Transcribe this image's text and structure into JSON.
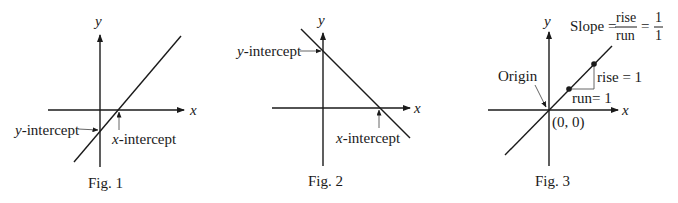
{
  "colors": {
    "ink": "#1a1a1a",
    "guide": "#555555",
    "background": "#ffffff"
  },
  "figures": [
    {
      "caption": "Fig. 1",
      "axis_x_label": "x",
      "axis_y_label": "y",
      "line": "positive slope, crosses x-axis right of origin and y-axis below origin",
      "annotations": {
        "y_intercept": "y-intercept",
        "x_intercept": "x-intercept"
      }
    },
    {
      "caption": "Fig. 2",
      "axis_x_label": "x",
      "axis_y_label": "y",
      "line": "negative slope, crosses y-axis above origin and x-axis right of origin",
      "annotations": {
        "y_intercept": "y-intercept",
        "x_intercept": "x-intercept"
      }
    },
    {
      "caption": "Fig. 3",
      "axis_x_label": "x",
      "axis_y_label": "y",
      "line": "slope 1 through origin",
      "annotations": {
        "origin": "Origin",
        "origin_coords": "(0, 0)",
        "rise": "rise = 1",
        "run": "run= 1",
        "slope_prefix": "Slope =",
        "slope_num": "rise",
        "slope_den": "run",
        "slope_eq": "=",
        "slope_val_num": "1",
        "slope_val_den": "1"
      }
    }
  ]
}
